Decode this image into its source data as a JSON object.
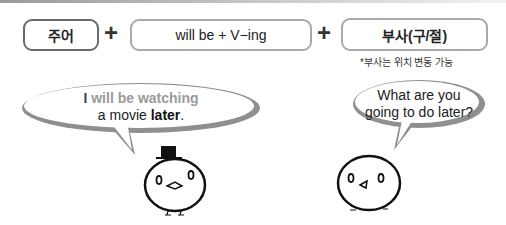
{
  "formula": {
    "subject": "주어",
    "plus": "+",
    "verb_pattern": "will be + V−ing",
    "adverb": "부사(구/절)",
    "note": "*부사는 위치 변동 가능"
  },
  "bubbles": {
    "left": {
      "pronoun": "I",
      "verb_phrase": " will be watching",
      "line2_pre": "a movie ",
      "line2_bold": "later",
      "line2_post": "."
    },
    "right": {
      "line1": "What are you",
      "line2": "going to do later?"
    }
  },
  "colors": {
    "highlight_gray": "#9a9a9a",
    "bubble_border": "#9a9a9a",
    "box_border_dark": "#6a6a6a",
    "box_border_light": "#a9a9a9"
  }
}
